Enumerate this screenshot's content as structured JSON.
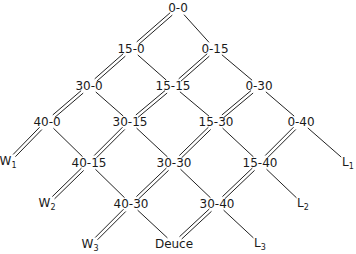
{
  "diagram": {
    "title": "",
    "nodes": [
      {
        "id": "0-0",
        "label": "0-0",
        "x": 178,
        "y": 8
      },
      {
        "id": "15-0",
        "label": "15-0",
        "x": 131,
        "y": 49
      },
      {
        "id": "0-15",
        "label": "0-15",
        "x": 215,
        "y": 49
      },
      {
        "id": "30-0",
        "label": "30-0",
        "x": 89,
        "y": 86
      },
      {
        "id": "15-15",
        "label": "15-15",
        "x": 173,
        "y": 86
      },
      {
        "id": "0-30",
        "label": "0-30",
        "x": 259,
        "y": 86
      },
      {
        "id": "40-0",
        "label": "40-0",
        "x": 47,
        "y": 122
      },
      {
        "id": "30-15",
        "label": "30-15",
        "x": 130,
        "y": 122
      },
      {
        "id": "15-30",
        "label": "15-30",
        "x": 216,
        "y": 122
      },
      {
        "id": "0-40",
        "label": "0-40",
        "x": 301,
        "y": 122
      },
      {
        "id": "40-15",
        "label": "40-15",
        "x": 89,
        "y": 163
      },
      {
        "id": "30-30",
        "label": "30-30",
        "x": 174,
        "y": 163
      },
      {
        "id": "15-40",
        "label": "15-40",
        "x": 260,
        "y": 163
      },
      {
        "id": "40-30",
        "label": "40-30",
        "x": 131,
        "y": 204
      },
      {
        "id": "30-40",
        "label": "30-40",
        "x": 217,
        "y": 204
      },
      {
        "id": "Deuce",
        "label": "Deuce",
        "x": 174,
        "y": 244
      }
    ],
    "terminals": [
      {
        "id": "W1",
        "base": "W",
        "sub": "1",
        "x": 8,
        "y": 162
      },
      {
        "id": "W2",
        "base": "W",
        "sub": "2",
        "x": 47,
        "y": 204
      },
      {
        "id": "W3",
        "base": "W",
        "sub": "3",
        "x": 90,
        "y": 245
      },
      {
        "id": "L1",
        "base": "L",
        "sub": "1",
        "x": 348,
        "y": 163
      },
      {
        "id": "L2",
        "base": "L",
        "sub": "2",
        "x": 303,
        "y": 204
      },
      {
        "id": "L3",
        "base": "L",
        "sub": "3",
        "x": 260,
        "y": 244
      }
    ],
    "edges": [
      {
        "from": "0-0",
        "to": "15-0",
        "style": "double"
      },
      {
        "from": "0-0",
        "to": "0-15",
        "style": "single"
      },
      {
        "from": "15-0",
        "to": "30-0",
        "style": "double"
      },
      {
        "from": "15-0",
        "to": "15-15",
        "style": "single"
      },
      {
        "from": "0-15",
        "to": "15-15",
        "style": "double"
      },
      {
        "from": "0-15",
        "to": "0-30",
        "style": "single"
      },
      {
        "from": "30-0",
        "to": "40-0",
        "style": "double"
      },
      {
        "from": "30-0",
        "to": "30-15",
        "style": "single"
      },
      {
        "from": "15-15",
        "to": "30-15",
        "style": "double"
      },
      {
        "from": "15-15",
        "to": "15-30",
        "style": "single"
      },
      {
        "from": "0-30",
        "to": "15-30",
        "style": "double"
      },
      {
        "from": "0-30",
        "to": "0-40",
        "style": "single"
      },
      {
        "from": "40-0",
        "to": "W1",
        "style": "double"
      },
      {
        "from": "40-0",
        "to": "40-15",
        "style": "single"
      },
      {
        "from": "30-15",
        "to": "40-15",
        "style": "double"
      },
      {
        "from": "30-15",
        "to": "30-30",
        "style": "single"
      },
      {
        "from": "15-30",
        "to": "30-30",
        "style": "double"
      },
      {
        "from": "15-30",
        "to": "15-40",
        "style": "single"
      },
      {
        "from": "0-40",
        "to": "15-40",
        "style": "double"
      },
      {
        "from": "0-40",
        "to": "L1",
        "style": "single"
      },
      {
        "from": "40-15",
        "to": "W2",
        "style": "double"
      },
      {
        "from": "40-15",
        "to": "40-30",
        "style": "single"
      },
      {
        "from": "30-30",
        "to": "40-30",
        "style": "double"
      },
      {
        "from": "30-30",
        "to": "30-40",
        "style": "single"
      },
      {
        "from": "15-40",
        "to": "30-40",
        "style": "double"
      },
      {
        "from": "15-40",
        "to": "L2",
        "style": "single"
      },
      {
        "from": "40-30",
        "to": "W3",
        "style": "double"
      },
      {
        "from": "40-30",
        "to": "Deuce",
        "style": "single"
      },
      {
        "from": "30-40",
        "to": "Deuce",
        "style": "double"
      },
      {
        "from": "30-40",
        "to": "L3",
        "style": "single"
      }
    ]
  }
}
